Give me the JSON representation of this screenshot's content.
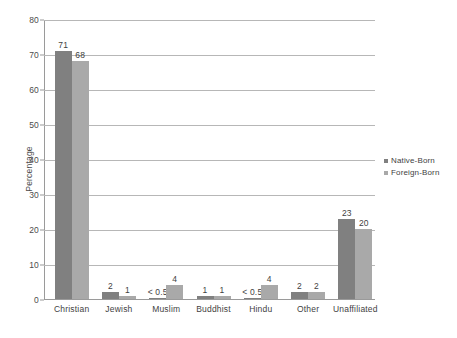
{
  "chart_data": {
    "type": "bar",
    "title": "",
    "xlabel": "",
    "ylabel": "Percentage",
    "ylim": [
      0,
      80
    ],
    "yticks": [
      0,
      10,
      20,
      30,
      40,
      50,
      60,
      70,
      80
    ],
    "grid": true,
    "legend_position": "right",
    "categories": [
      "Christian",
      "Jewish",
      "Muslim",
      "Buddhist",
      "Hindu",
      "Other",
      "Unaffiliated"
    ],
    "series": [
      {
        "name": "Native-Born",
        "color": "#808080",
        "values": [
          71,
          2,
          0.4,
          1,
          0.4,
          2,
          23
        ],
        "labels": [
          "71",
          "2",
          "< 0.5",
          "1",
          "< 0.5",
          "2",
          "23"
        ]
      },
      {
        "name": "Foreign-Born",
        "color": "#a9a9a9",
        "values": [
          68,
          1,
          4,
          1,
          4,
          2,
          20
        ],
        "labels": [
          "68",
          "1",
          "4",
          "1",
          "4",
          "2",
          "20"
        ]
      }
    ]
  }
}
